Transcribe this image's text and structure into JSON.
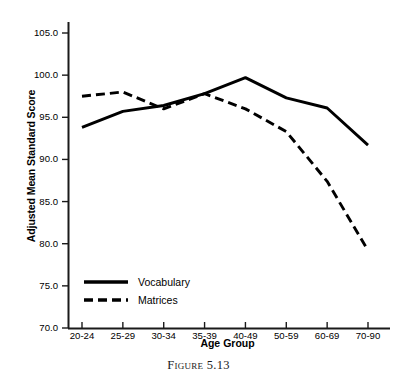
{
  "caption": "Figure 5.13",
  "colors": {
    "axis": "#1a1a1a",
    "vocabulary": "#000000",
    "matrices": "#000000",
    "background": "#ffffff"
  },
  "legend": {
    "position": "inside-lower-left",
    "entries": [
      {
        "label": "Vocabulary",
        "style": "solid"
      },
      {
        "label": "Matrices",
        "style": "dashed"
      }
    ]
  },
  "chart_data": {
    "type": "line",
    "title": "",
    "subtitle": "",
    "xlabel": "Age Group",
    "ylabel": "Adjusted Mean Standard Score",
    "categories": [
      "20-24",
      "25-29",
      "30-34",
      "35-39",
      "40-49",
      "50-59",
      "60-69",
      "70-90"
    ],
    "ylim": [
      70.0,
      105.0
    ],
    "yticks": [
      70.0,
      75.0,
      80.0,
      85.0,
      90.0,
      95.0,
      100.0,
      105.0
    ],
    "ytick_labels": [
      "70.0",
      "75.0",
      "80.0",
      "85.0",
      "90.0",
      "95.0",
      "100.0",
      "105.0"
    ],
    "grid": false,
    "legend_position": "inside-lower-left",
    "series": [
      {
        "name": "Vocabulary",
        "style": "solid",
        "values": [
          93.8,
          95.7,
          96.4,
          97.8,
          99.7,
          97.3,
          96.1,
          91.7
        ]
      },
      {
        "name": "Matrices",
        "style": "dashed",
        "values": [
          97.5,
          98.0,
          96.0,
          97.8,
          96.0,
          93.3,
          87.4,
          79.2
        ]
      }
    ]
  }
}
